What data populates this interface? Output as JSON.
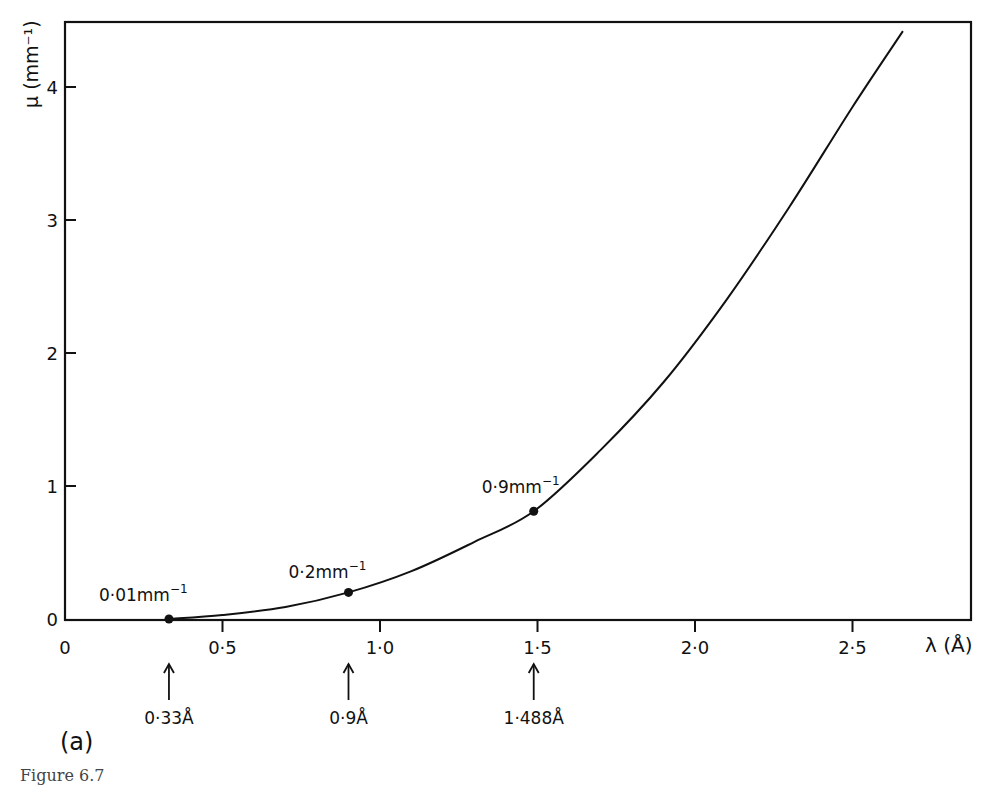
{
  "figure": {
    "panel_label": "(a)",
    "caption_fragment": "Figure 6.7"
  },
  "chart_data": {
    "type": "line",
    "title": "",
    "xlabel": "λ (Å)",
    "ylabel": "μ (mm⁻¹)",
    "xlim": [
      0,
      2.88
    ],
    "ylim": [
      0,
      4.5
    ],
    "x_ticks": [
      0,
      0.5,
      1.0,
      1.5,
      2.0,
      2.5
    ],
    "x_tick_labels": [
      "0",
      "0·5",
      "1·0",
      "1·5",
      "2·0",
      "2·5"
    ],
    "y_ticks": [
      0,
      1,
      2,
      3,
      4
    ],
    "y_tick_labels": [
      "0",
      "1",
      "2",
      "3",
      "4"
    ],
    "grid": false,
    "legend": null,
    "series": [
      {
        "name": "μ vs λ",
        "x": [
          0.33,
          0.5,
          0.7,
          0.9,
          1.1,
          1.3,
          1.488,
          1.7,
          1.9,
          2.1,
          2.3,
          2.5,
          2.66
        ],
        "values": [
          0.0,
          0.03,
          0.09,
          0.2,
          0.36,
          0.58,
          0.81,
          1.27,
          1.78,
          2.4,
          3.1,
          3.85,
          4.42
        ]
      }
    ],
    "marked_points": [
      {
        "x": 0.33,
        "y": 0.0,
        "label": "0·01mm",
        "sup": "−1",
        "arrow_label": "0·33Å"
      },
      {
        "x": 0.9,
        "y": 0.2,
        "label": "0·2mm",
        "sup": "−1",
        "arrow_label": "0·9Å"
      },
      {
        "x": 1.488,
        "y": 0.81,
        "label": "0·9mm",
        "sup": "−1",
        "arrow_label": "1·488Å"
      }
    ]
  }
}
